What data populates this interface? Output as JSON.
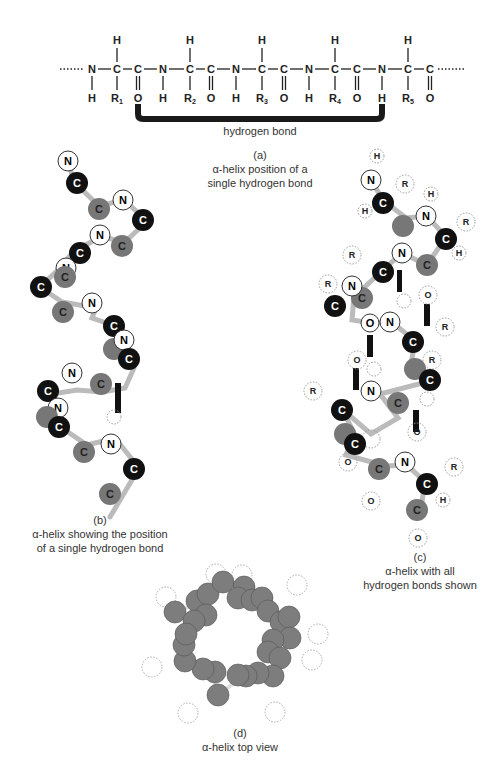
{
  "chain": {
    "backbone": [
      "N",
      "C",
      "C",
      "N",
      "C",
      "C",
      "N",
      "C",
      "C",
      "N",
      "C",
      "C",
      "N",
      "C",
      "C"
    ],
    "top_labels": [
      "H",
      "H",
      "H",
      "H",
      "H"
    ],
    "bottom_labels": [
      "H",
      "R1",
      "O",
      "H",
      "R2",
      "O",
      "H",
      "R3",
      "O",
      "H",
      "R4",
      "O",
      "H",
      "R5",
      "O"
    ],
    "bond_label": "hydrogen bond"
  },
  "panels": {
    "a": {
      "letter": "(a)",
      "line1": "α-helix position of a",
      "line2": "single hydrogen bond"
    },
    "b": {
      "letter": "(b)",
      "line1": "α-helix showing the position",
      "line2": "of a single hydrogen bond"
    },
    "c": {
      "letter": "(c)",
      "line1": "α-helix with all",
      "line2": "hydrogen bonds shown"
    },
    "d": {
      "letter": "(d)",
      "line1": "α-helix top view"
    }
  },
  "atoms": {
    "N": "N",
    "C": "C",
    "Calpha": "Cα",
    "H": "H",
    "O": "O",
    "R": "R"
  },
  "colors": {
    "N": "#ffffff",
    "C": "#777777",
    "Calpha": "#111111",
    "bond": "#222222"
  }
}
